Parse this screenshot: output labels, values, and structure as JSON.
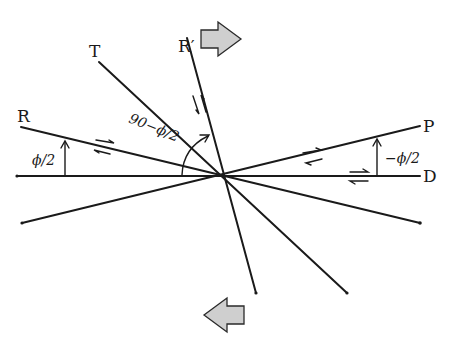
{
  "figure": {
    "labels": {
      "R": "R",
      "R_prime": "R′",
      "T": "T",
      "P": "P",
      "D": "D"
    },
    "angles": {
      "phi_half": "ϕ/2",
      "ninety_minus_phi_half": "90−ϕ/2",
      "minus_phi_half": "−ϕ/2"
    },
    "colors": {
      "line": "#1a1a1a",
      "arrow_fill": "#cfcfcf"
    },
    "large_arrows": [
      {
        "name": "upper-displacement-arrow",
        "direction": "right"
      },
      {
        "name": "lower-displacement-arrow",
        "direction": "left"
      }
    ]
  }
}
